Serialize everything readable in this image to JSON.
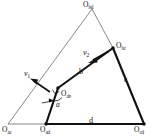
{
  "figure": {
    "background_color": "#ffffff",
    "stroke_color": "#111111",
    "thin_stroke_color": "#555555",
    "width": 155,
    "height": 140
  },
  "points": [
    {
      "id": "O_ac",
      "base": "O",
      "sub": "ac",
      "label_x": 2,
      "label_y": 126,
      "x": 8,
      "y": 124
    },
    {
      "id": "O_ad",
      "base": "O",
      "sub": "ad",
      "label_x": 40,
      "label_y": 126,
      "x": 46,
      "y": 124
    },
    {
      "id": "O_cd",
      "base": "O",
      "sub": "cd",
      "label_x": 134,
      "label_y": 126,
      "x": 144,
      "y": 124
    },
    {
      "id": "O_bc",
      "base": "O",
      "sub": "bc",
      "label_x": 116,
      "label_y": 44,
      "x": 113,
      "y": 48
    },
    {
      "id": "O_ab",
      "base": "O",
      "sub": "ab",
      "label_x": 60,
      "label_y": 92,
      "x": 58,
      "y": 88
    },
    {
      "id": "O_bd",
      "base": "O",
      "sub": "bd",
      "label_x": 83,
      "label_y": 1,
      "x": 92,
      "y": 9
    }
  ],
  "links": [
    {
      "id": "b",
      "label": "b",
      "label_x": 79,
      "label_y": 72,
      "from": "O_ab",
      "to": "O_bc"
    },
    {
      "id": "c",
      "label": "c",
      "label_x": 124,
      "label_y": 79,
      "from": "O_bc",
      "to": "O_cd"
    },
    {
      "id": "d",
      "label": "d",
      "label_x": 89,
      "label_y": 120,
      "from": "O_ad",
      "to": "O_cd"
    }
  ],
  "vectors": [
    {
      "id": "v1",
      "base": "v",
      "sub": "1",
      "label_x": 24,
      "label_y": 73,
      "tail_x": 50,
      "tail_y": 92,
      "tip_x": 32,
      "tip_y": 80
    },
    {
      "id": "v2",
      "base": "v",
      "sub": "2",
      "label_x": 83,
      "label_y": 52,
      "tail_x": 108,
      "tail_y": 52,
      "tip_x": 89,
      "tip_y": 62
    }
  ],
  "angle": {
    "id": "alpha",
    "label": "a",
    "label_x": 56,
    "label_y": 104,
    "vertex": "O_ab"
  }
}
